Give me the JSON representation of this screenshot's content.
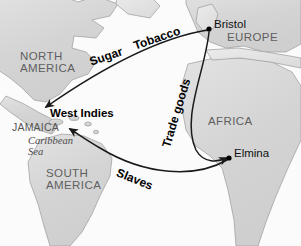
{
  "map": {
    "title": "Triangular Trade Routes",
    "colors": {
      "land": "#d9d9d9",
      "land_edge": "#8c8c8c",
      "ocean": "#fbfbfb",
      "route_line": "#1a1a1a",
      "city_dot": "#000000",
      "continent_text": "#5f5f5f",
      "city_text": "#111111",
      "route_text": "#000000"
    },
    "continents": [
      {
        "name": "north-america",
        "label": "NORTH\nAMERICA",
        "x": 20,
        "y": 51,
        "font_size": 11.5
      },
      {
        "name": "south-america",
        "label": "SOUTH\nAMERICA",
        "x": 46,
        "y": 168,
        "font_size": 11.5
      },
      {
        "name": "europe",
        "label": "EUROPE",
        "x": 227,
        "y": 32,
        "font_size": 11.5
      },
      {
        "name": "africa",
        "label": "AFRICA",
        "x": 208,
        "y": 116,
        "font_size": 11.5
      }
    ],
    "regions": [
      {
        "name": "jamaica",
        "label": "JAMAICA",
        "x": 12,
        "y": 122,
        "font_size": 10.5
      }
    ],
    "waters": [
      {
        "name": "caribbean-sea",
        "label": "Caribbean\nSea",
        "x": 28,
        "y": 136,
        "font_size": 10.5
      }
    ],
    "places": [
      {
        "name": "west-indies",
        "label": "West Indies",
        "x": 50,
        "y": 108,
        "font_size": 11.5
      }
    ],
    "cities": [
      {
        "name": "bristol",
        "label": "Bristol",
        "dot_x": 209,
        "dot_y": 29,
        "label_x": 214,
        "label_y": 19
      },
      {
        "name": "elmina",
        "label": "Elmina",
        "dot_x": 229,
        "dot_y": 158,
        "label_x": 234,
        "label_y": 148
      }
    ],
    "routes": [
      {
        "name": "sugar-tobacco",
        "labels": [
          "Sugar",
          "Tobacco"
        ],
        "from": "West Indies",
        "to": "Bristol",
        "direction": "west-to-east"
      },
      {
        "name": "trade-goods",
        "labels": [
          "Trade goods"
        ],
        "from": "Bristol",
        "to": "Elmina",
        "direction": "north-to-south"
      },
      {
        "name": "slaves",
        "labels": [
          "Slaves"
        ],
        "from": "Elmina",
        "to": "West Indies",
        "direction": "east-to-west"
      }
    ],
    "route_labels": [
      {
        "name": "sugar",
        "text": "Sugar",
        "x": 90,
        "y": 56,
        "rotate": -19
      },
      {
        "name": "tobacco",
        "text": "Tobacco",
        "x": 134,
        "y": 40,
        "rotate": -19
      },
      {
        "name": "trade-goods",
        "text": "Trade goods",
        "x": 166,
        "y": 141,
        "rotate": -73
      },
      {
        "name": "slaves",
        "text": "Slaves",
        "x": 117,
        "y": 166,
        "rotate": 22
      }
    ]
  }
}
